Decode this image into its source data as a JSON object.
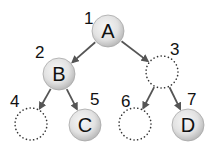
{
  "diagram": {
    "type": "binary-tree-array-representation",
    "colors": {
      "edge": "#555555",
      "empty_node_stroke": "#333333",
      "node_fill_center": "#f4f4f4",
      "node_fill_edge": "#b9b9b9",
      "text": "#111111"
    },
    "nodes": [
      {
        "index": "1",
        "letter": "A",
        "filled": true,
        "cx": 108,
        "cy": 31,
        "label_x": 84,
        "label_y": 24
      },
      {
        "index": "2",
        "letter": "B",
        "filled": true,
        "cx": 59,
        "cy": 74,
        "label_x": 35,
        "label_y": 58
      },
      {
        "index": "3",
        "letter": "",
        "filled": false,
        "cx": 162,
        "cy": 72,
        "label_x": 170,
        "label_y": 55
      },
      {
        "index": "4",
        "letter": "",
        "filled": false,
        "cx": 31,
        "cy": 124,
        "label_x": 10,
        "label_y": 107
      },
      {
        "index": "5",
        "letter": "C",
        "filled": true,
        "cx": 85,
        "cy": 125,
        "label_x": 90,
        "label_y": 105
      },
      {
        "index": "6",
        "letter": "",
        "filled": false,
        "cx": 135,
        "cy": 124,
        "label_x": 121,
        "label_y": 107
      },
      {
        "index": "7",
        "letter": "D",
        "filled": true,
        "cx": 188,
        "cy": 125,
        "label_x": 187,
        "label_y": 105
      }
    ],
    "edges": [
      {
        "from": "1",
        "to": "2"
      },
      {
        "from": "1",
        "to": "3"
      },
      {
        "from": "2",
        "to": "4"
      },
      {
        "from": "2",
        "to": "5"
      },
      {
        "from": "3",
        "to": "6"
      },
      {
        "from": "3",
        "to": "7"
      }
    ]
  }
}
